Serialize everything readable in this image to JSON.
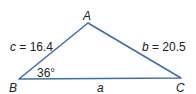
{
  "diagram": {
    "type": "triangle",
    "line_color": "#3a6fb5",
    "vertices": {
      "A": {
        "label": "A",
        "x": 88,
        "y": 23
      },
      "B": {
        "label": "B",
        "x": 19,
        "y": 79
      },
      "C": {
        "label": "C",
        "x": 181,
        "y": 78
      }
    },
    "sides": {
      "a": {
        "label": "a"
      },
      "b": {
        "var": "b",
        "eq": " = 20.5"
      },
      "c": {
        "var": "c",
        "eq": " = 16.4"
      }
    },
    "angle_B": {
      "label": "36°"
    }
  }
}
